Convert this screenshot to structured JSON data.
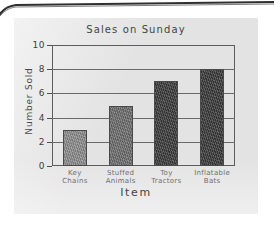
{
  "chart_data": {
    "type": "bar",
    "title": "Sales on Sunday",
    "xlabel": "Item",
    "ylabel": "Number Sold",
    "categories": [
      "Key Chains",
      "Stuffed Animals",
      "Toy Tractors",
      "Inflatable Bats"
    ],
    "values": [
      3,
      5,
      7,
      8
    ],
    "ylim": [
      0,
      10
    ],
    "yticks": [
      0,
      2,
      4,
      6,
      8,
      10
    ],
    "ytick_labels": [
      "0",
      "2",
      "4",
      "6",
      "8",
      "10"
    ],
    "grid": true,
    "legend": "none",
    "style": "hand-drawn pencil sketch on gray paper",
    "bar_colors": [
      "#8f8f8f",
      "#6f6f6f",
      "#3b3b3b",
      "#3a3a3a"
    ]
  },
  "media": {
    "surface": "worksheet-paper",
    "paper_color": "#e3e3e3",
    "page_edge_color": "#2f2f2f",
    "background_color": "#ffffff"
  }
}
